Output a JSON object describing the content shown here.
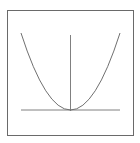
{
  "figure": {
    "curve": "parabola",
    "vertex": "origin",
    "opens": "upward"
  },
  "colors": {
    "frame": "#6a6a6a",
    "axes": "#808080",
    "curve": "#707070",
    "background": "#ffffff"
  }
}
